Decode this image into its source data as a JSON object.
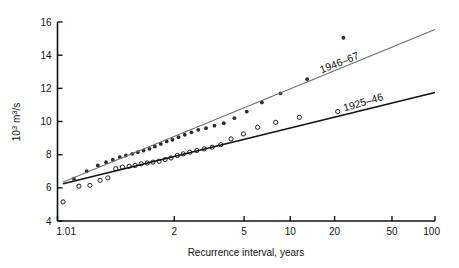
{
  "chart_data": {
    "type": "scatter",
    "title": "",
    "xlabel": "Recurrence interval, years",
    "ylabel": "10³ m³/s",
    "xscale": "gumbel-probability",
    "yscale": "linear",
    "xlim": [
      1.01,
      100
    ],
    "ylim": [
      4,
      16
    ],
    "grid": false,
    "legend_position": "inline-annotations",
    "xticks": [
      "1.01",
      "2",
      "5",
      "10",
      "20",
      "50",
      "100"
    ],
    "xtick_values": [
      1.01,
      2,
      5,
      10,
      20,
      50,
      100
    ],
    "yticks": [
      "4",
      "6",
      "8",
      "10",
      "12",
      "14",
      "16"
    ],
    "ytick_values": [
      4,
      6,
      8,
      10,
      12,
      14,
      16
    ],
    "series": [
      {
        "name": "1946-67",
        "label": "1946–67",
        "marker": "filled-circle",
        "color": "#2b2b2b",
        "line_color": "#6e6e6e",
        "x": [
          1.03,
          1.06,
          1.1,
          1.14,
          1.18,
          1.23,
          1.28,
          1.34,
          1.4,
          1.47,
          1.55,
          1.63,
          1.73,
          1.84,
          1.96,
          2.1,
          2.26,
          2.45,
          2.67,
          2.95,
          3.3,
          3.75,
          4.35,
          5.2,
          6.5,
          8.6,
          13.0,
          23.0
        ],
        "y": [
          6.55,
          7.0,
          7.35,
          7.55,
          7.7,
          7.85,
          7.95,
          8.05,
          8.15,
          8.25,
          8.35,
          8.5,
          8.65,
          8.8,
          8.9,
          9.05,
          9.2,
          9.35,
          9.5,
          9.6,
          9.75,
          9.9,
          10.2,
          10.6,
          11.15,
          11.7,
          12.55,
          15.05
        ],
        "fit_line": {
          "x1": 1.015,
          "y1": 6.35,
          "x2": 100.0,
          "y2": 15.55
        }
      },
      {
        "name": "1925-46",
        "label": "1925–46",
        "marker": "open-circle",
        "color": "#1a1a1a",
        "line_color": "#111111",
        "x": [
          1.015,
          1.04,
          1.07,
          1.11,
          1.15,
          1.2,
          1.25,
          1.31,
          1.37,
          1.44,
          1.52,
          1.6,
          1.7,
          1.81,
          1.93,
          2.07,
          2.22,
          2.4,
          2.62,
          2.88,
          3.2,
          3.6,
          4.15,
          4.95,
          6.1,
          8.0,
          11.5,
          21.0
        ],
        "y": [
          5.15,
          6.1,
          6.15,
          6.45,
          6.6,
          7.15,
          7.25,
          7.3,
          7.35,
          7.45,
          7.5,
          7.55,
          7.6,
          7.7,
          7.8,
          7.95,
          8.05,
          8.15,
          8.25,
          8.35,
          8.45,
          8.6,
          8.95,
          9.25,
          9.65,
          9.95,
          10.25,
          10.6
        ],
        "fit_line": {
          "x1": 1.015,
          "y1": 6.25,
          "x2": 100.0,
          "y2": 11.75
        }
      }
    ],
    "annotations": [
      {
        "text": "1946–67",
        "x": 22.0,
        "y": 13.35,
        "rotation": -21.5,
        "series": "1946-67"
      },
      {
        "text": "1925–46",
        "x": 32.0,
        "y": 10.95,
        "rotation": -16.5,
        "series": "1925-46"
      }
    ],
    "outlier_points": [
      {
        "series": "1946-67",
        "x": 23.0,
        "y": 15.05,
        "note": "high outlier above fit line"
      }
    ]
  }
}
